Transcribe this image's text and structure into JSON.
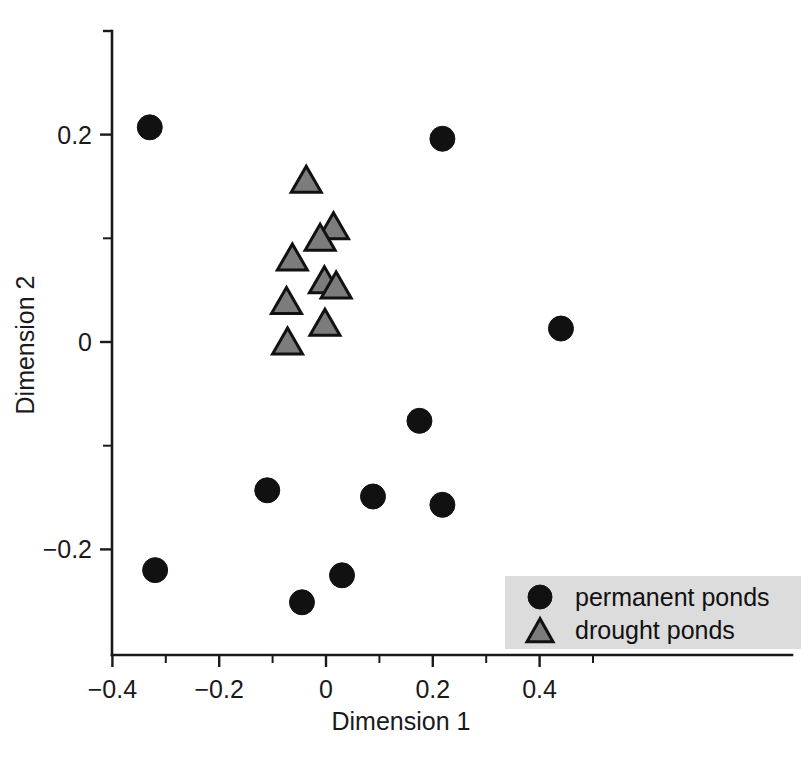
{
  "chart_data": {
    "type": "scatter",
    "title": "",
    "xlabel": "Dimension 1",
    "ylabel": "Dimension 2",
    "xlim": [
      -0.42,
      0.5
    ],
    "ylim": [
      -0.285,
      0.255
    ],
    "grid": false,
    "legend_position": "bottom-right",
    "xticks": [
      -0.4,
      -0.2,
      0,
      0.2,
      0.4
    ],
    "xticklabels": [
      "−0.4",
      "−0.2",
      "0",
      "0.2",
      "0.4"
    ],
    "xminorticks": [
      -0.3,
      -0.1,
      0.1,
      0.3,
      0.5
    ],
    "yticks": [
      0.2,
      0,
      -0.2
    ],
    "yticklabels": [
      "0.2",
      "0",
      "−0.2"
    ],
    "yminorticks": [
      0.1,
      -0.1
    ],
    "series": [
      {
        "name": "permanent ponds",
        "marker": "circle",
        "color": "#111111",
        "points": [
          {
            "x": -0.33,
            "y": 0.207
          },
          {
            "x": -0.32,
            "y": -0.22
          },
          {
            "x": -0.11,
            "y": -0.143
          },
          {
            "x": -0.045,
            "y": -0.251
          },
          {
            "x": 0.03,
            "y": -0.225
          },
          {
            "x": 0.088,
            "y": -0.149
          },
          {
            "x": 0.175,
            "y": -0.076
          },
          {
            "x": 0.218,
            "y": 0.196
          },
          {
            "x": 0.218,
            "y": -0.157
          },
          {
            "x": 0.44,
            "y": 0.013
          }
        ]
      },
      {
        "name": "drought ponds",
        "marker": "triangle",
        "color": "#7c7c7c",
        "points": [
          {
            "x": -0.037,
            "y": 0.155
          },
          {
            "x": 0.014,
            "y": 0.11
          },
          {
            "x": -0.011,
            "y": 0.099
          },
          {
            "x": -0.063,
            "y": 0.08
          },
          {
            "x": -0.003,
            "y": 0.058
          },
          {
            "x": 0.019,
            "y": 0.053
          },
          {
            "x": -0.074,
            "y": 0.038
          },
          {
            "x": -0.002,
            "y": 0.017
          },
          {
            "x": -0.072,
            "y": -0.001
          }
        ]
      }
    ],
    "legend": [
      {
        "label": "permanent ponds",
        "marker": "circle",
        "color": "#111111"
      },
      {
        "label": "drought ponds",
        "marker": "triangle",
        "color": "#7c7c7c"
      }
    ],
    "legend_background": "#dcdcdc"
  }
}
